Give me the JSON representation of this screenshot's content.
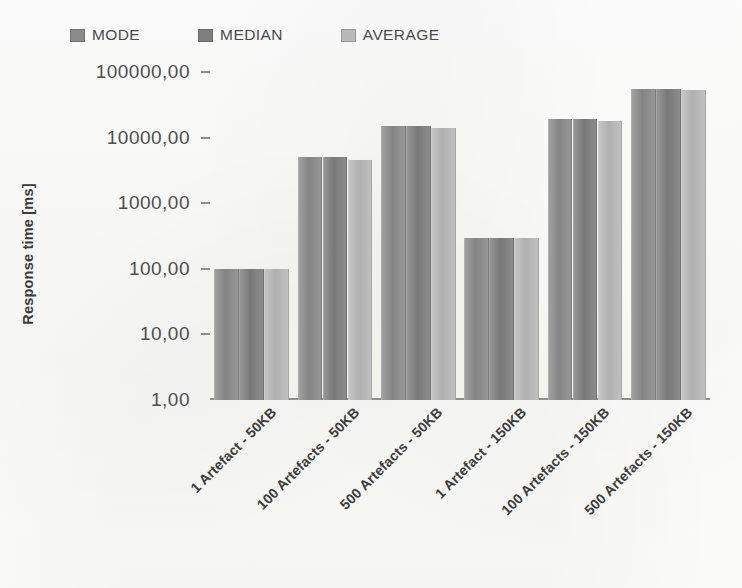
{
  "chart_data": {
    "type": "bar",
    "title": "",
    "xlabel": "",
    "ylabel": "Response time [ms]",
    "yscale": "log",
    "ylim": [
      1,
      100000
    ],
    "grid": false,
    "legend_position": "top",
    "ytick_labels": [
      "100000,00",
      "10000,00",
      "1000,00",
      "100,00",
      "10,00",
      "1,00"
    ],
    "ytick_values": [
      100000,
      10000,
      1000,
      100,
      10,
      1
    ],
    "categories": [
      "1 Artefact - 50KB",
      "100 Artefacts - 50KB",
      "500 Artefacts - 50KB",
      "1 Artefact - 150KB",
      "100 Artefacts - 150KB",
      "500 Artefacts - 150KB"
    ],
    "series": [
      {
        "name": "MODE",
        "color": "#8b8b8b",
        "values": [
          100,
          5000,
          15000,
          300,
          19000,
          55000
        ]
      },
      {
        "name": "MEDIAN",
        "color": "#7f7f7f",
        "values": [
          100,
          5000,
          15000,
          300,
          19000,
          55000
        ]
      },
      {
        "name": "AVERAGE",
        "color": "#b9b9b9",
        "values": [
          98,
          4600,
          14000,
          290,
          18000,
          54000
        ]
      }
    ]
  },
  "legend": {
    "items": [
      {
        "label": "MODE",
        "color": "#8b8b8b"
      },
      {
        "label": "MEDIAN",
        "color": "#7f7f7f"
      },
      {
        "label": "AVERAGE",
        "color": "#b9b9b9"
      }
    ]
  }
}
